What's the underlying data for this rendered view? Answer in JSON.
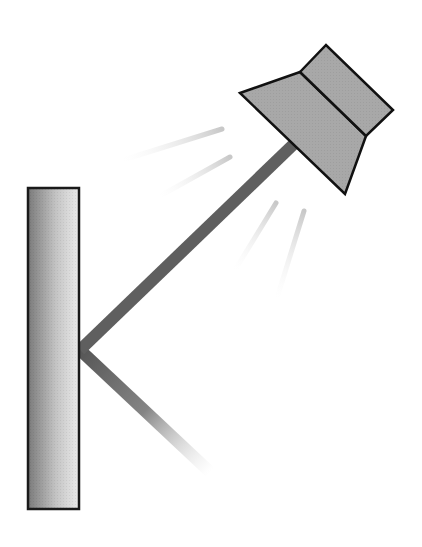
{
  "diagram": {
    "elements": [
      {
        "name": "wall",
        "type": "rectangle",
        "fill": "gradient-gray"
      },
      {
        "name": "upper-arm",
        "type": "rod",
        "color": "#5f5f5f"
      },
      {
        "name": "lower-arm",
        "type": "rod",
        "color": "#6a6a6a",
        "fades_out": true
      },
      {
        "name": "lamp-head",
        "type": "polygon",
        "fill": "#a8a8a8"
      },
      {
        "name": "light-rays",
        "type": "lines",
        "count": 4,
        "color": "#d0d0d0"
      }
    ],
    "colors": {
      "wall_dark": "#7a7a7a",
      "wall_light": "#e8e8e8",
      "outline": "#1a1a1a",
      "arm": "#5f5f5f",
      "lamp": "#a8a8a8",
      "ray": "#cfcfcf"
    }
  }
}
